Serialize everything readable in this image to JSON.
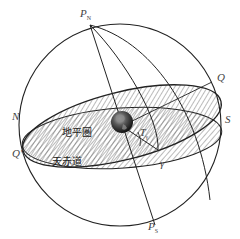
{
  "diagram": {
    "labels": {
      "north_pole": "P",
      "north_pole_sub": "N",
      "south_pole": "P",
      "south_pole_sub": "S",
      "equator_point_right": "Q",
      "equator_point_left": "Q'",
      "horizon_north": "N",
      "horizon_south": "S",
      "vernal_equinox": "γ",
      "hour_angle": "T",
      "hour_angle_sub": "γ",
      "horizon_plane": "地平圏",
      "equator_plane": "天赤道"
    },
    "colors": {
      "stroke": "#222222",
      "hatch": "#555555",
      "earth_dark": "#1a1a1a",
      "earth_light": "#9a9a9a",
      "background": "#ffffff"
    }
  }
}
